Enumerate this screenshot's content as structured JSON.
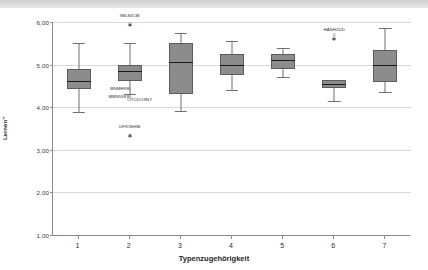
{
  "chart_data": {
    "type": "box",
    "title": "",
    "xlabel": "Typenzugehörigkeit",
    "ylabel": "Mittelwertskala \"Selbstständiges und verständnisvolles diskursives Lernen\"",
    "ylim": [
      1.0,
      6.0
    ],
    "yticks": [
      "1,00",
      "2,00",
      "3,00",
      "4,00",
      "5,00",
      "6,00"
    ],
    "ytick_values": [
      1.0,
      2.0,
      3.0,
      4.0,
      5.0,
      6.0
    ],
    "categories": [
      "1",
      "2",
      "3",
      "4",
      "5",
      "6",
      "7"
    ],
    "grid": true,
    "legend": "none",
    "box_fill_color": "#8c8c8c",
    "box_edge_color": "#5c5c5c",
    "median_color": "#1a1a1a",
    "boxes": [
      {
        "category": "1",
        "whisker_low": 3.88,
        "q1": 4.42,
        "median": 4.62,
        "q3": 4.9,
        "whisker_high": 5.5
      },
      {
        "category": "2",
        "whisker_low": 4.3,
        "q1": 4.62,
        "median": 4.85,
        "q3": 5.0,
        "whisker_high": 5.5
      },
      {
        "category": "3",
        "whisker_low": 3.9,
        "q1": 4.32,
        "median": 5.05,
        "q3": 5.5,
        "whisker_high": 5.75
      },
      {
        "category": "4",
        "whisker_low": 4.4,
        "q1": 4.75,
        "median": 5.0,
        "q3": 5.25,
        "whisker_high": 5.55
      },
      {
        "category": "5",
        "whisker_low": 4.7,
        "q1": 4.9,
        "median": 5.1,
        "q3": 5.25,
        "whisker_high": 5.4
      },
      {
        "category": "6",
        "whisker_low": 4.15,
        "q1": 4.45,
        "median": 4.55,
        "q3": 4.65,
        "whisker_high": 4.65
      },
      {
        "category": "7",
        "whisker_low": 4.35,
        "q1": 4.6,
        "median": 5.0,
        "q3": 5.35,
        "whisker_high": 5.85
      }
    ],
    "outliers": [
      {
        "category": "2",
        "value": 5.95,
        "label": "IML84CM",
        "label_position": "above"
      },
      {
        "category": "2",
        "value": 3.35,
        "label": "DFK36HM",
        "label_position": "above"
      },
      {
        "category": "6",
        "value": 5.62,
        "label": "HASH2DD\nC",
        "label_position": "above"
      }
    ],
    "case_labels": [
      {
        "text": "BNMRKR,",
        "x_category": "2",
        "value": 4.42,
        "dx": -9,
        "dy": -3
      },
      {
        "text": "MBN55KW",
        "x_category": "2",
        "value": 4.3,
        "dx": -10,
        "dy": 0
      },
      {
        "text": "OTCDO3NT",
        "x_category": "2",
        "value": 4.26,
        "dx": 10,
        "dy": 1
      }
    ]
  }
}
